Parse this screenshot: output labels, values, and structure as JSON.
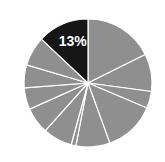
{
  "chart_data": {
    "type": "pie",
    "title": "",
    "categories": [
      "S1",
      "S2",
      "S3",
      "S4",
      "S5",
      "S6",
      "S7",
      "S8",
      "S9",
      "S10",
      "S11",
      "S12"
    ],
    "values": [
      17.7,
      9.5,
      4.3,
      13.1,
      8.6,
      1.2,
      7.4,
      6.7,
      5.5,
      5.8,
      7.5,
      13
    ],
    "colors": [
      "#8f8f8f",
      "#8f8f8f",
      "#8f8f8f",
      "#8f8f8f",
      "#8f8f8f",
      "#8f8f8f",
      "#8f8f8f",
      "#8f8f8f",
      "#8f8f8f",
      "#8f8f8f",
      "#8f8f8f",
      "#161616"
    ],
    "highlight_index": 11,
    "annotations": [
      {
        "slice": 11,
        "text": "13%"
      }
    ],
    "start_angle_deg": 0,
    "direction": "clockwise",
    "separator_color": "#ffffff",
    "legend": "none"
  }
}
